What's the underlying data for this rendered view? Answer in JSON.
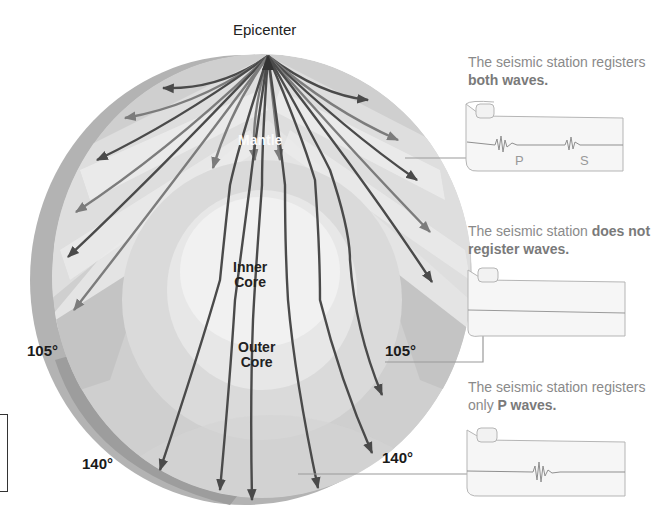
{
  "diagram": {
    "title": "Epicenter",
    "layers": {
      "mantle": "Mantle",
      "inner_core": [
        "Inner",
        "Core"
      ],
      "outer_core": [
        "Outer",
        "Core"
      ]
    },
    "angles": {
      "left_105": "105°",
      "right_105": "105°",
      "left_140": "140°",
      "right_140": "140°"
    },
    "stations": [
      {
        "caption_prefix": "The seismic station registers ",
        "caption_bold": "both waves.",
        "wave_labels": [
          "P",
          "S"
        ],
        "waves": "both"
      },
      {
        "caption_prefix": "The seismic station ",
        "caption_bold": "does not register waves.",
        "wave_labels": [],
        "waves": "none"
      },
      {
        "caption_prefix": "The seismic station registers only ",
        "caption_bold": "P waves.",
        "wave_labels": [],
        "waves": "P"
      }
    ],
    "colors": {
      "rim_dark": "#a9a9a9",
      "mantle_light": "#e2e2e2",
      "shadow_zone": "#c9c9c9",
      "outer_core": "#d8d8d8",
      "inner_core": "#ededed",
      "ray_dark": "#4a4a4a",
      "ray_mid": "#7a7a7a",
      "caption": "#8a8a8a"
    }
  }
}
